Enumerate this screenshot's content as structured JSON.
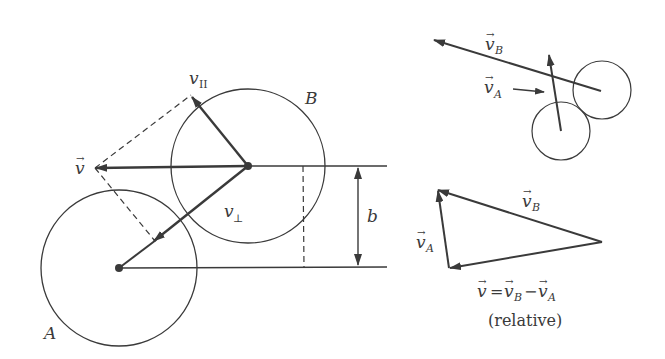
{
  "colors": {
    "ink": "#3a3a3a",
    "background": "#ffffff"
  },
  "main_diagram": {
    "circles": [
      {
        "label": "A",
        "cx": 119,
        "cy": 268,
        "r": 78
      },
      {
        "label": "B",
        "cx": 248,
        "cy": 166,
        "r": 77
      }
    ],
    "labels": {
      "circle_a": "A",
      "circle_b": "B",
      "v": "v",
      "v_parallel": "v",
      "v_parallel_sub": "II",
      "v_perp": "v",
      "v_perp_sub": "⊥",
      "impact_parameter": "b",
      "vec_arrow": "→"
    }
  },
  "top_right": {
    "labels": {
      "v_b": "v",
      "v_b_sub": "B",
      "v_a": "v",
      "v_a_sub": "A",
      "vec_arrow": "→"
    }
  },
  "bottom_right": {
    "labels": {
      "v_b": "v",
      "v_b_sub": "B",
      "v_a": "v",
      "v_a_sub": "A",
      "equation_v": "v",
      "equation_eq": "=",
      "equation_vb": "v",
      "equation_vb_sub": "B",
      "equation_minus": "−",
      "equation_va": "v",
      "equation_va_sub": "A",
      "relative": "(relative)",
      "vec_arrow": "→"
    }
  }
}
